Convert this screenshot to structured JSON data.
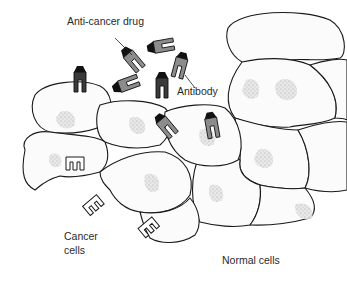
{
  "diagram": {
    "labels": {
      "drug": "Anti-cancer drug",
      "antibody": "Antibody",
      "cancer_line1": "Cancer",
      "cancer_line2": "cells",
      "normal": "Normal cells"
    },
    "colors": {
      "outline": "#1a1a1a",
      "antibody_fill": "#8c8c8c",
      "drug_fill": "#111111",
      "cell_fill": "#fbfbfb",
      "background": "#ffffff"
    }
  }
}
